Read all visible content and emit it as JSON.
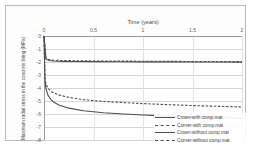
{
  "chart_data": {
    "type": "line",
    "title": "Time (years)",
    "xlabel": "Time (years)",
    "ylabel": "Maximum radial stress in the concrete lining (MPa)",
    "xlim": [
      0,
      2
    ],
    "ylim": [
      -8,
      0
    ],
    "xticks": [
      "0",
      "0.5",
      "1",
      "1.5",
      "2"
    ],
    "xtick_values": [
      0,
      0.5,
      1,
      1.5,
      2
    ],
    "yticks": [
      "0",
      "-1",
      "-2",
      "-3",
      "-4",
      "-5",
      "-6",
      "-7",
      "-8"
    ],
    "ytick_values": [
      0,
      -1,
      -2,
      -3,
      -4,
      -5,
      -6,
      -7,
      -8
    ],
    "grid": true,
    "legend_position": "bottom-right",
    "x_axis_position": "top",
    "series": [
      {
        "name": "Crown-with comp.mat",
        "style": "solid",
        "color": "#4d4d4d",
        "x": [
          0,
          0.02,
          0.05,
          0.1,
          0.2,
          0.3,
          0.5,
          0.75,
          1.0,
          1.25,
          1.5,
          1.75,
          2.0
        ],
        "values": [
          0.0,
          -1.78,
          -1.88,
          -1.92,
          -1.95,
          -1.96,
          -1.97,
          -1.98,
          -1.99,
          -1.99,
          -2.0,
          -2.0,
          -2.01
        ]
      },
      {
        "name": "Corner-with comp.mat",
        "style": "dashed",
        "color": "#4d4d4d",
        "x": [
          0,
          0.02,
          0.05,
          0.1,
          0.2,
          0.3,
          0.5,
          0.75,
          1.0,
          1.25,
          1.5,
          1.75,
          2.0
        ],
        "values": [
          0.0,
          -1.72,
          -1.82,
          -1.86,
          -1.89,
          -1.9,
          -1.92,
          -1.93,
          -1.94,
          -1.95,
          -1.96,
          -1.96,
          -1.97
        ]
      },
      {
        "name": "Crown-without comp.mat",
        "style": "solid",
        "color": "#4d4d4d",
        "x": [
          0,
          0.01,
          0.02,
          0.04,
          0.07,
          0.1,
          0.15,
          0.25,
          0.4,
          0.6,
          0.8,
          1.0,
          1.25,
          1.5,
          1.75,
          2.0
        ],
        "values": [
          0.0,
          -3.45,
          -4.05,
          -4.55,
          -4.9,
          -5.1,
          -5.3,
          -5.55,
          -5.75,
          -5.9,
          -6.0,
          -6.08,
          -6.16,
          -6.22,
          -6.27,
          -6.32
        ]
      },
      {
        "name": "Corner-without comp.mat",
        "style": "dashed",
        "color": "#4d4d4d",
        "x": [
          0,
          0.01,
          0.02,
          0.04,
          0.07,
          0.1,
          0.15,
          0.25,
          0.4,
          0.6,
          0.8,
          1.0,
          1.25,
          1.5,
          1.75,
          2.0
        ],
        "values": [
          0.0,
          -3.3,
          -3.7,
          -4.02,
          -4.25,
          -4.38,
          -4.53,
          -4.72,
          -4.9,
          -5.03,
          -5.12,
          -5.2,
          -5.28,
          -5.35,
          -5.41,
          -5.46
        ]
      }
    ]
  },
  "legend": {
    "items": [
      {
        "label": "Crown-with comp.mat"
      },
      {
        "label": "Corner-with comp.mat"
      },
      {
        "label": "Crown-without comp.mat"
      },
      {
        "label": "Corner-without comp.mat"
      }
    ]
  }
}
